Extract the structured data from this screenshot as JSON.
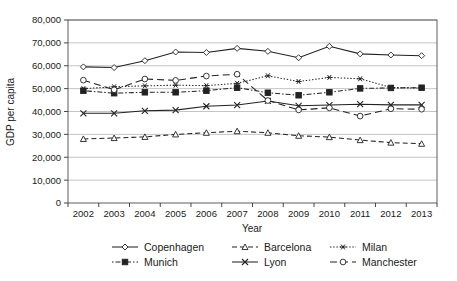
{
  "chart_data": {
    "type": "line",
    "title": "",
    "xlabel": "Year",
    "ylabel": "GDP per capita",
    "categories": [
      2002,
      2003,
      2004,
      2005,
      2006,
      2007,
      2008,
      2009,
      2010,
      2011,
      2012,
      2013
    ],
    "x_tick_labels": [
      "2002",
      "2003",
      "2004",
      "2005",
      "2006",
      "2007",
      "2008",
      "2009",
      "2010",
      "2011",
      "2012",
      "2013"
    ],
    "y_tick_labels": [
      "0",
      "10,000",
      "20,000",
      "30,000",
      "40,000",
      "50,000",
      "60,000",
      "70,000",
      "80,000"
    ],
    "y_tick_values": [
      0,
      10000,
      20000,
      30000,
      40000,
      50000,
      60000,
      70000,
      80000
    ],
    "ylim": [
      0,
      80000
    ],
    "grid": true,
    "legend_position": "bottom",
    "series": [
      {
        "name": "Copenhagen",
        "marker": "diamond",
        "dash": "none",
        "values": [
          59500,
          59200,
          62200,
          66000,
          65800,
          67600,
          66300,
          63500,
          68500,
          65200,
          64700,
          64400
        ]
      },
      {
        "name": "Barcelona",
        "marker": "triangle",
        "dash": "dashed",
        "values": [
          28000,
          28400,
          28900,
          30000,
          30700,
          31400,
          30700,
          29400,
          28800,
          27500,
          26400,
          25900
        ]
      },
      {
        "name": "Milan",
        "marker": "asterisk",
        "dash": "dotted",
        "values": [
          50000,
          50800,
          51200,
          51500,
          51300,
          52300,
          55600,
          53100,
          54900,
          54300,
          50500,
          50200
        ]
      },
      {
        "name": "Munich",
        "marker": "square",
        "dash": "dashdot",
        "values": [
          49100,
          48000,
          48400,
          48400,
          49100,
          50400,
          48200,
          47100,
          48400,
          50100,
          50300,
          50400
        ]
      },
      {
        "name": "Lyon",
        "marker": "cross",
        "dash": "none",
        "values": [
          39200,
          39200,
          40300,
          40600,
          42300,
          42800,
          44600,
          42500,
          42800,
          43200,
          42900,
          42900
        ]
      },
      {
        "name": "Manchester",
        "marker": "circle",
        "dash": "longdash",
        "values": [
          53700,
          49500,
          54200,
          53600,
          55500,
          56300,
          44800,
          40700,
          41600,
          38000,
          41200,
          41000
        ]
      }
    ]
  },
  "layout": {
    "plot_left": 68,
    "plot_right": 437,
    "plot_top": 20,
    "plot_bottom": 203,
    "legend_rows": [
      [
        "Copenhagen",
        "Barcelona",
        "Milan"
      ],
      [
        "Munich",
        "Lyon",
        "Manchester"
      ]
    ],
    "legend_col_x": [
      112,
      232,
      330
    ],
    "legend_row_y": [
      247,
      262
    ]
  },
  "colors": {
    "ink": "#222222",
    "grid": "#aaaaaa",
    "frame": "#4d4d4d",
    "background": "#ffffff"
  }
}
